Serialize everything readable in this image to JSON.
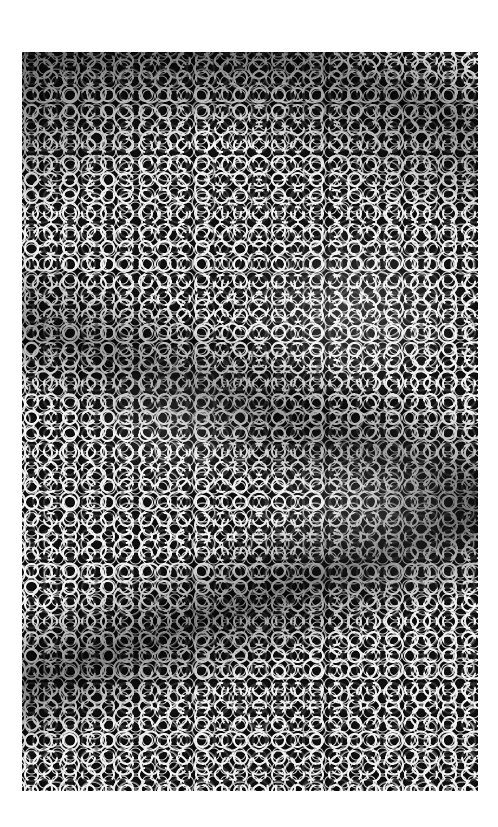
{
  "image": {
    "subject": "black-and-white marbled bubble texture",
    "background_color": "#ffffff",
    "plate": {
      "left": 22,
      "top": 52,
      "width": 456,
      "height": 739,
      "base_color": "#0a0a0a",
      "vein_color": "#f2f2f2"
    }
  }
}
